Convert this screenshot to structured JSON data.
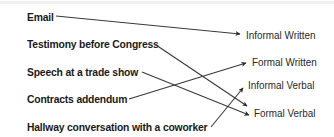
{
  "diagram": {
    "type": "matching",
    "sources": [
      {
        "label": "Email",
        "x": 27,
        "y": 10
      },
      {
        "label": "Testimony before Congress",
        "x": 27,
        "y": 37
      },
      {
        "label": "Speech at a trade show",
        "x": 27,
        "y": 65
      },
      {
        "label": "Contracts addendum",
        "x": 27,
        "y": 92
      },
      {
        "label": "Hallway conversation with a coworker",
        "x": 27,
        "y": 120
      }
    ],
    "targets": [
      {
        "label": "Informal Written",
        "x": 246,
        "y": 28
      },
      {
        "label": "Formal Written",
        "x": 252,
        "y": 55
      },
      {
        "label": "Informal Verbal",
        "x": 248,
        "y": 78
      },
      {
        "label": "Formal Verbal",
        "x": 254,
        "y": 106
      }
    ],
    "connections": [
      {
        "from": "Email",
        "to": "Informal Written"
      },
      {
        "from": "Testimony before Congress",
        "to": "Formal Verbal"
      },
      {
        "from": "Speech at a trade show",
        "to": "Formal Verbal"
      },
      {
        "from": "Contracts addendum",
        "to": "Formal Written"
      },
      {
        "from": "Hallway conversation with a coworker",
        "to": "Informal Verbal"
      }
    ],
    "line_color": "#3a3a3a"
  }
}
